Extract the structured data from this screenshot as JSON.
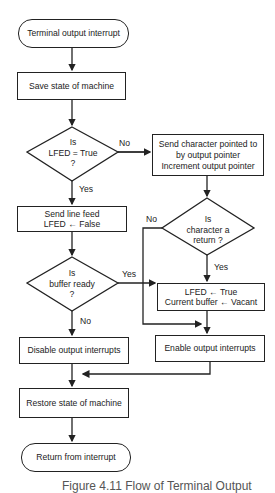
{
  "flowchart": {
    "start": "Terminal output interrupt",
    "save_state": "Save state of machine",
    "decision_lfed": {
      "line1": "Is",
      "line2": "LFED = True",
      "line3": "?"
    },
    "send_char": {
      "line1": "Send character pointed to",
      "line2": "by output pointer",
      "line3": "Increment output pointer"
    },
    "send_linefeed": {
      "line1": "Send line feed",
      "line2": "LFED ← False"
    },
    "decision_return": {
      "line1": "Is",
      "line2": "character a",
      "line3": "return ?"
    },
    "decision_buffer": {
      "line1": "Is",
      "line2": "buffer ready",
      "line3": "?"
    },
    "set_lfed": {
      "line1": "LFED ← True",
      "line2": "Current buffer ← Vacant"
    },
    "disable": "Disable output interrupts",
    "enable": "Enable output interrupts",
    "restore_state": "Restore state of machine",
    "end": "Return from interrupt",
    "labels": {
      "lfed_no": "No",
      "lfed_yes": "Yes",
      "return_no": "No",
      "return_yes": "Yes",
      "buffer_yes": "Yes",
      "buffer_no": "No"
    }
  },
  "caption": "Figure 4.11  Flow of Terminal Output"
}
